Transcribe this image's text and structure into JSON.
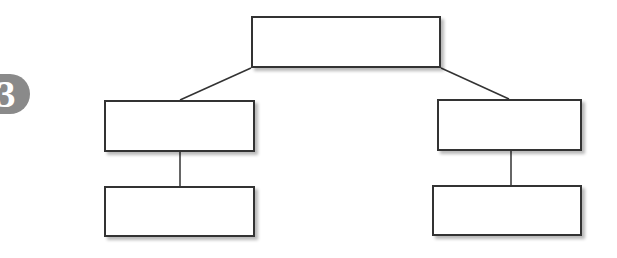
{
  "badge": {
    "label": "3",
    "color": "#8a8a8a",
    "text_color": "#ffffff"
  },
  "diagram": {
    "type": "org-chart / hierarchy",
    "line_color": "#333333",
    "nodes": [
      {
        "id": "root",
        "label": "",
        "x": 251,
        "y": 16,
        "w": 190,
        "h": 52
      },
      {
        "id": "left-child",
        "label": "",
        "x": 104,
        "y": 100,
        "w": 151,
        "h": 52
      },
      {
        "id": "left-grandchild",
        "label": "",
        "x": 104,
        "y": 186,
        "w": 151,
        "h": 51
      },
      {
        "id": "right-child",
        "label": "",
        "x": 437,
        "y": 99,
        "w": 145,
        "h": 52
      },
      {
        "id": "right-grandchild",
        "label": "",
        "x": 432,
        "y": 185,
        "w": 150,
        "h": 51
      }
    ],
    "edges": [
      {
        "from": "root",
        "to": "left-child"
      },
      {
        "from": "root",
        "to": "right-child"
      },
      {
        "from": "left-child",
        "to": "left-grandchild"
      },
      {
        "from": "right-child",
        "to": "right-grandchild"
      }
    ]
  }
}
